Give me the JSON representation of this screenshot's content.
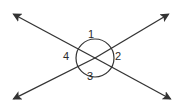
{
  "figure": {
    "background_color": "#ffffff",
    "stroke_color": "#333333",
    "label_color": "#2b2b2b",
    "canvas": {
      "width": 184,
      "height": 112
    },
    "intersection_point": {
      "x": 95,
      "y": 58
    },
    "circle": {
      "name": "angle-circle",
      "center_x": 95,
      "center_y": 58,
      "radius": 19
    },
    "lines": [
      {
        "name": "line-down-right",
        "from": {
          "x": 12,
          "y": 13
        },
        "to": {
          "x": 172,
          "y": 100
        },
        "arrow_start": true,
        "arrow_end": true
      },
      {
        "name": "line-up-right",
        "from": {
          "x": 12,
          "y": 100
        },
        "to": {
          "x": 170,
          "y": 13
        },
        "arrow_start": true,
        "arrow_end": true
      }
    ],
    "angle_labels": [
      {
        "id": "1",
        "text": "1",
        "position": "top"
      },
      {
        "id": "2",
        "text": "2",
        "position": "right"
      },
      {
        "id": "3",
        "text": "3",
        "position": "bottom"
      },
      {
        "id": "4",
        "text": "4",
        "position": "left"
      }
    ]
  }
}
